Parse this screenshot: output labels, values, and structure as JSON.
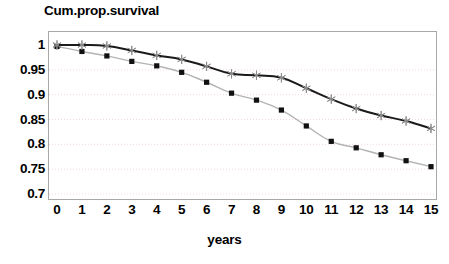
{
  "chart_data": {
    "type": "line",
    "title": "Cum.prop.survival",
    "xlabel": "years",
    "ylabel": "",
    "xlim": [
      0,
      15
    ],
    "ylim": [
      0.7,
      1.0
    ],
    "grid": true,
    "grid_axis": "y",
    "legend": "none",
    "x": [
      0,
      1,
      2,
      3,
      4,
      5,
      6,
      7,
      8,
      9,
      10,
      11,
      12,
      13,
      14,
      15
    ],
    "xticklabels": [
      "0",
      "1",
      "2",
      "3",
      "4",
      "5",
      "6",
      "7",
      "8",
      "9",
      "10",
      "11",
      "12",
      "13",
      "14",
      "15"
    ],
    "yticks": [
      1,
      0.95,
      0.9,
      0.85,
      0.8,
      0.75,
      0.7
    ],
    "yticklabels": [
      "1",
      "0.95",
      "0.9",
      "0.85",
      "0.8",
      "0.75",
      "0.7"
    ],
    "series": [
      {
        "name": "upper-curve",
        "marker": "star",
        "marker_color": "#8c8c8c",
        "line_color": "#1a1a1a",
        "line_width": 2.0,
        "values": [
          1.0,
          1.0,
          0.998,
          0.989,
          0.979,
          0.971,
          0.957,
          0.942,
          0.939,
          0.934,
          0.913,
          0.891,
          0.872,
          0.858,
          0.847,
          0.832
        ]
      },
      {
        "name": "lower-curve",
        "marker": "square",
        "marker_color": "#111111",
        "line_color": "#b3b3b3",
        "line_width": 1.4,
        "values": [
          0.997,
          0.987,
          0.978,
          0.967,
          0.958,
          0.945,
          0.925,
          0.903,
          0.889,
          0.869,
          0.837,
          0.806,
          0.793,
          0.779,
          0.767,
          0.755
        ]
      }
    ],
    "colors": {
      "frame": "#a8a8a8",
      "gridline": "#f0d8d8",
      "background": "#ffffff",
      "text": "#000000"
    }
  }
}
